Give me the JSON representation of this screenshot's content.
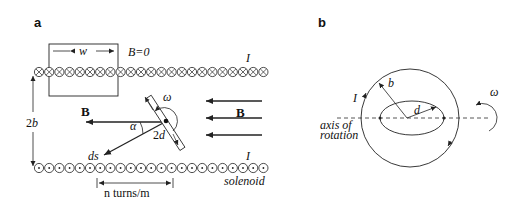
{
  "figure": {
    "panel_a": {
      "label": "a",
      "box_width_label": "w",
      "field_outside_label": "B=0",
      "current_top_label": "I",
      "current_bottom_label": "I",
      "height_label": "2b",
      "field_left_label": "B",
      "field_right_label": "B",
      "angle_label": "α",
      "rod_length_label": "2d",
      "angular_velocity_label": "ω",
      "ds_label": "ds",
      "turns_density_label": "n turns/m",
      "solenoid_label": "solenoid",
      "top_row_symbol": "current-into-page",
      "bottom_row_symbol": "current-out-of-page",
      "wire_count_per_row": 23
    },
    "panel_b": {
      "label": "b",
      "outer_radius_label": "b",
      "inner_radius_label": "d",
      "current_label": "I",
      "angular_velocity_label": "ω",
      "axis_label_line1": "axis of",
      "axis_label_line2": "rotation"
    },
    "colors": {
      "ink": "#222222",
      "background": "#ffffff"
    }
  }
}
